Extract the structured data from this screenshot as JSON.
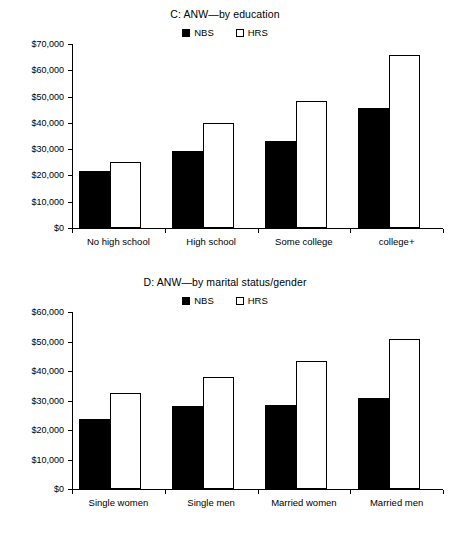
{
  "chart_data": [
    {
      "id": "C",
      "type": "bar",
      "title": "C: ANW—by education",
      "xlabel": "",
      "ylabel": "",
      "ylim": [
        0,
        70000
      ],
      "ytick_labels": [
        "$0",
        "$10,000",
        "$20,000",
        "$30,000",
        "$40,000",
        "$50,000",
        "$60,000",
        "$70,000"
      ],
      "ytick_values": [
        0,
        10000,
        20000,
        30000,
        40000,
        50000,
        60000,
        70000
      ],
      "grid": false,
      "legend_position": "top-center",
      "categories": [
        "No high school",
        "High school",
        "Some college",
        "college+"
      ],
      "series": [
        {
          "name": "NBS",
          "style": "filled",
          "values": [
            21700,
            29300,
            33200,
            45600
          ]
        },
        {
          "name": "HRS",
          "style": "open",
          "values": [
            25200,
            39900,
            48300,
            65700
          ]
        }
      ]
    },
    {
      "id": "D",
      "type": "bar",
      "title": "D: ANW—by marital status/gender",
      "xlabel": "",
      "ylabel": "",
      "ylim": [
        0,
        60000
      ],
      "ytick_labels": [
        "$0",
        "$10,000",
        "$20,000",
        "$30,000",
        "$40,000",
        "$50,000",
        "$60,000"
      ],
      "ytick_values": [
        0,
        10000,
        20000,
        30000,
        40000,
        50000,
        60000
      ],
      "grid": false,
      "legend_position": "top-center",
      "categories": [
        "Single women",
        "Single men",
        "Married women",
        "Married men"
      ],
      "series": [
        {
          "name": "NBS",
          "style": "filled",
          "values": [
            23700,
            28100,
            28400,
            30900
          ]
        },
        {
          "name": "HRS",
          "style": "open",
          "values": [
            32400,
            37900,
            43400,
            50900
          ]
        }
      ]
    }
  ],
  "legend": {
    "nbs_label": "NBS",
    "hrs_label": "HRS"
  },
  "colors": {
    "nbs": "#000000",
    "hrs": "#ffffff",
    "axis": "#000000",
    "background": "#ffffff"
  }
}
